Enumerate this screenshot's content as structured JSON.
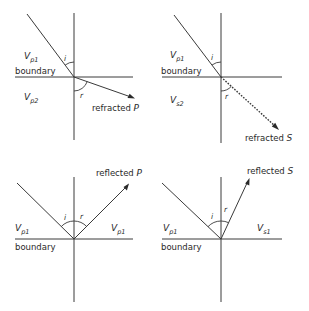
{
  "figure": {
    "panels": [
      {
        "id": "refracted-p",
        "upper_layer": {
          "symbol": "V",
          "subscript": "p1"
        },
        "lower_layer": {
          "symbol": "V",
          "subscript": "p2"
        },
        "boundary_label": "boundary",
        "incidence_angle_label": "i",
        "ray_angle_label": "r",
        "ray_label": "refracted",
        "ray_wave": "P",
        "ray_style": "solid"
      },
      {
        "id": "refracted-s",
        "upper_layer": {
          "symbol": "V",
          "subscript": "p1"
        },
        "lower_layer": {
          "symbol": "V",
          "subscript": "s2"
        },
        "boundary_label": "boundary",
        "incidence_angle_label": "i",
        "ray_angle_label": "r",
        "ray_label": "refracted",
        "ray_wave": "S",
        "ray_style": "dotted"
      },
      {
        "id": "reflected-p",
        "left_layer": {
          "symbol": "V",
          "subscript": "p1"
        },
        "right_layer": {
          "symbol": "V",
          "subscript": "p1"
        },
        "boundary_label": "boundary",
        "incidence_angle_label": "i",
        "ray_angle_label": "r",
        "ray_label": "reflected",
        "ray_wave": "P",
        "ray_style": "solid"
      },
      {
        "id": "reflected-s",
        "left_layer": {
          "symbol": "V",
          "subscript": "p1"
        },
        "right_layer": {
          "symbol": "V",
          "subscript": "s1"
        },
        "boundary_label": "boundary",
        "incidence_angle_label": "i",
        "ray_angle_label": "r",
        "ray_label": "reflected",
        "ray_wave": "S",
        "ray_style": "solid"
      }
    ]
  }
}
